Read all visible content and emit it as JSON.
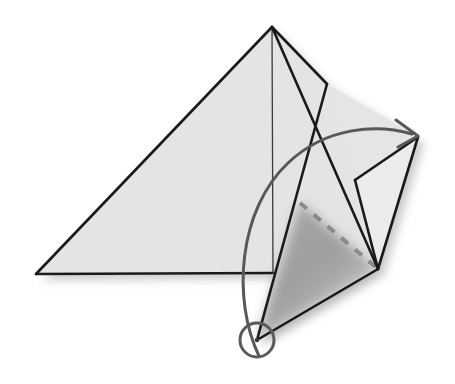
{
  "figure": {
    "title": "Tetrahedron fold diagram",
    "canvas": {
      "width": 455,
      "height": 384,
      "background": "#ffffff"
    },
    "colors": {
      "stroke": "#1a1a1a",
      "face_light": "#e4e4e4",
      "face_flap": "#ececec",
      "face_shadow": "#8e8e8e",
      "dashed": "#8a8a8a",
      "arrow": "#585858",
      "pivot_ring": "#5a5a5a",
      "drop_shadow": "#b9b9b9"
    },
    "stroke_widths": {
      "edge": 2.6,
      "interior_edge": 1.4,
      "dashed": 4.0,
      "arc": 3.0,
      "ring": 3.0
    },
    "points": {
      "apex": [
        272,
        27
      ],
      "left_base": [
        36,
        274
      ],
      "base_right": [
        273,
        273
      ],
      "flap_hinge": [
        327,
        84
      ],
      "right_tip": [
        418,
        137
      ],
      "lower_right": [
        378,
        269
      ],
      "pivot": [
        257,
        340
      ],
      "dash_start": [
        300,
        203
      ],
      "mid_right": [
        355,
        180
      ]
    },
    "shapes": [
      {
        "name": "main-triangle-face",
        "type": "polygon",
        "fill": "#e4e4e4",
        "pts": "272,27 36,274 273,273"
      },
      {
        "name": "upper-flap-face",
        "type": "polygon",
        "fill": "#e4e4e4",
        "pts": "272,27 327,84 378,269 273,273"
      },
      {
        "name": "right-wing-face",
        "type": "polygon",
        "fill": "#ececec",
        "pts": "418,137 355,180 378,269"
      },
      {
        "name": "rotating-flap-face",
        "type": "polygon",
        "fill": "#e4e4e4",
        "pts": "327,84 378,269 257,340"
      },
      {
        "name": "shadow-triangle",
        "type": "polygon",
        "fill": "#8e8e8e",
        "pts": "300,203 378,269 257,340"
      }
    ],
    "edges": [
      {
        "name": "edge-apex-to-left-base",
        "pts": "272,27 36,274",
        "width": 2.6
      },
      {
        "name": "edge-left-base-to-base",
        "pts": "36,274 273,273",
        "width": 2.6
      },
      {
        "name": "edge-apex-to-base-right",
        "pts": "272,27 273,273",
        "width": 1.3
      },
      {
        "name": "edge-apex-to-hinge",
        "pts": "272,27 327,84",
        "width": 2.6
      },
      {
        "name": "edge-apex-to-lower-right",
        "pts": "272,27 378,269",
        "width": 2.6
      },
      {
        "name": "edge-hinge-to-pivot",
        "pts": "327,84 257,340",
        "width": 2.6
      },
      {
        "name": "edge-pivot-to-lower-right",
        "pts": "257,340 378,269",
        "width": 2.6
      },
      {
        "name": "edge-lower-right-to-tip",
        "pts": "378,269 418,137",
        "width": 2.6
      },
      {
        "name": "edge-tip-to-midright",
        "pts": "418,137 355,180",
        "width": 2.6
      },
      {
        "name": "edge-midright-to-lowerright",
        "pts": "355,180 378,269",
        "width": 2.6
      }
    ],
    "dashed_edge": {
      "name": "hidden-fold-edge",
      "pts": "300,203 378,269",
      "dash_pattern": "9 9",
      "color": "#8a8a8a",
      "width": 4.0
    },
    "rotation_arrow": {
      "name": "rotation-arrow",
      "path": "M 259,356 C 232,300 238,210 288,163 C 327,126 378,124 412,134",
      "arrowhead": "M 396,120 L 418,136 L 398,147",
      "color": "#585858",
      "width": 3.0,
      "direction": "counterclockwise-to-right"
    },
    "pivot_marker": {
      "name": "pivot-point-marker",
      "cx": 257,
      "cy": 340,
      "r": 17,
      "stroke": "#5a5a5a",
      "width": 3.0,
      "fill": "none"
    },
    "labels": []
  }
}
